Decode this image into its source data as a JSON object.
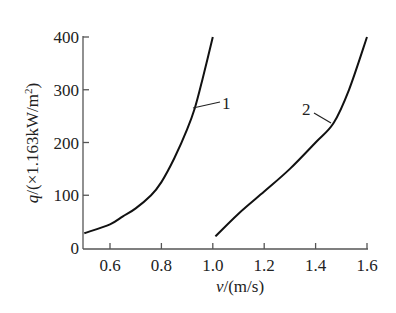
{
  "chart_data": {
    "type": "line",
    "title": "",
    "xlabel": "v/(m/s)",
    "ylabel": "q/(×1.163kW/m²)",
    "xlim": [
      0.5,
      1.6
    ],
    "ylim": [
      0,
      400
    ],
    "x_ticks": [
      "0.6",
      "0.8",
      "1.0",
      "1.2",
      "1.4",
      "1.6"
    ],
    "y_ticks": [
      "0",
      "100",
      "200",
      "300",
      "400"
    ],
    "grid": false,
    "legend": "inline curve labels",
    "series": [
      {
        "name": "1",
        "x": [
          0.5,
          0.6,
          0.65,
          0.7,
          0.76,
          0.8,
          0.85,
          0.9,
          0.93,
          0.96,
          1.0
        ],
        "values": [
          28,
          45,
          60,
          75,
          100,
          125,
          170,
          225,
          265,
          320,
          400
        ]
      },
      {
        "name": "2",
        "x": [
          1.01,
          1.1,
          1.2,
          1.3,
          1.4,
          1.47,
          1.53,
          1.6
        ],
        "values": [
          22,
          65,
          107,
          150,
          200,
          237,
          300,
          400
        ]
      }
    ]
  },
  "labels": {
    "xlabel_var": "v",
    "xlabel_unit": "/(m/s)",
    "ylabel_var": "q",
    "ylabel_unit": "/(×1.163kW/m",
    "ylabel_sup": "2",
    "ylabel_close": ")",
    "curve1": "1",
    "curve2": "2"
  }
}
